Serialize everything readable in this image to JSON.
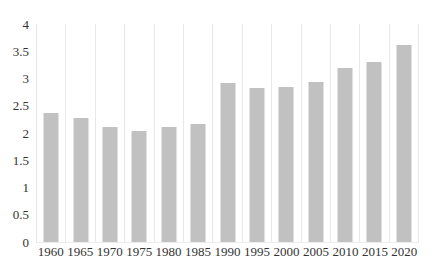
{
  "chart_data": {
    "type": "bar",
    "title": "",
    "xlabel": "",
    "ylabel": "",
    "categories": [
      "1960",
      "1965",
      "1970",
      "1975",
      "1980",
      "1985",
      "1990",
      "1995",
      "2000",
      "2005",
      "2010",
      "2015",
      "2020"
    ],
    "values": [
      2.37,
      2.27,
      2.11,
      2.03,
      2.11,
      2.16,
      2.91,
      2.82,
      2.84,
      2.94,
      3.19,
      3.31,
      3.62
    ],
    "ylim": [
      0,
      4
    ],
    "yticks": [
      0,
      0.5,
      1,
      1.5,
      2,
      2.5,
      3,
      3.5,
      4
    ],
    "ytick_labels": [
      "0",
      "0.5",
      "1",
      "1.5",
      "2",
      "2.5",
      "3",
      "3.5",
      "4"
    ],
    "grid": "vertical-category-boundaries",
    "legend": "none",
    "bar_color": "#c1c1c1",
    "gridline_color": "#e8e8e8",
    "text_color": "#333333",
    "background_color": "#ffffff"
  }
}
